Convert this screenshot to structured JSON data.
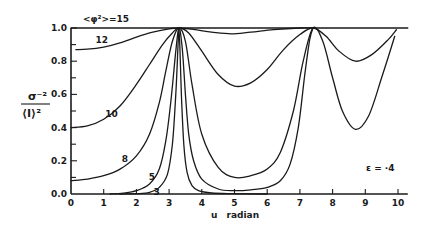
{
  "chart_data": {
    "type": "line",
    "title": "",
    "xlabel": "u radian",
    "ylabel_numerator": "σ⁻²",
    "ylabel_denominator": "⟨I⟩²",
    "annotation": "ε = ·4",
    "top_label": "<φ²>=15",
    "xlim": [
      0,
      10.3
    ],
    "ylim": [
      0,
      1.0
    ],
    "x_ticks": [
      "0",
      "1",
      "2",
      "3",
      "4",
      "5",
      "6",
      "7",
      "8",
      "9",
      "10"
    ],
    "y_ticks": [
      "0.0",
      "0.2",
      "0.4",
      "0.6",
      "0.8",
      "1.0"
    ],
    "grid": false,
    "series": [
      {
        "name": "15",
        "label_pos": [
          0.3,
          1.03
        ],
        "x": [
          0,
          10.3
        ],
        "y": [
          1.0,
          1.0
        ]
      },
      {
        "name": "12",
        "label_pos": [
          0.75,
          0.93
        ],
        "x": [
          0.15,
          0.5,
          1.0,
          1.5,
          2.0,
          2.5,
          3.0,
          3.3,
          3.8,
          4.3,
          4.9,
          5.5,
          6.2,
          7.0,
          7.4
        ],
        "y": [
          0.87,
          0.872,
          0.885,
          0.91,
          0.945,
          0.975,
          0.995,
          1.0,
          0.99,
          0.975,
          0.965,
          0.975,
          0.99,
          1.0,
          1.0
        ]
      },
      {
        "name": "10",
        "label_pos": [
          1.05,
          0.48
        ],
        "x": [
          0,
          0.5,
          1.0,
          1.5,
          2.0,
          2.4,
          2.8,
          3.1,
          3.3,
          3.6,
          4.0,
          4.5,
          5.0,
          5.5,
          6.0,
          6.5,
          7.0,
          7.4,
          7.8,
          8.2,
          8.7,
          9.2,
          9.7,
          9.95
        ],
        "y": [
          0.4,
          0.41,
          0.45,
          0.53,
          0.66,
          0.78,
          0.9,
          0.97,
          1.0,
          0.97,
          0.86,
          0.72,
          0.65,
          0.67,
          0.75,
          0.87,
          0.96,
          1.0,
          0.95,
          0.86,
          0.8,
          0.84,
          0.93,
          0.99
        ]
      },
      {
        "name": "8",
        "label_pos": [
          1.55,
          0.21
        ],
        "x": [
          0,
          0.5,
          1.0,
          1.5,
          2.0,
          2.4,
          2.7,
          2.9,
          3.1,
          3.3,
          3.5,
          3.7,
          4.0,
          4.5,
          5.0,
          5.5,
          6.0,
          6.4,
          6.8,
          7.1,
          7.4,
          7.7,
          8.0,
          8.3,
          8.7,
          9.1,
          9.5,
          9.9
        ],
        "y": [
          0.08,
          0.09,
          0.11,
          0.15,
          0.23,
          0.36,
          0.55,
          0.74,
          0.92,
          1.0,
          0.92,
          0.66,
          0.36,
          0.16,
          0.1,
          0.11,
          0.15,
          0.25,
          0.5,
          0.8,
          1.0,
          0.92,
          0.7,
          0.5,
          0.39,
          0.47,
          0.7,
          0.95
        ]
      },
      {
        "name": "5",
        "label_pos": [
          2.38,
          0.1
        ],
        "x": [
          1.2,
          1.6,
          2.0,
          2.4,
          2.7,
          2.9,
          3.05,
          3.2,
          3.3,
          3.4,
          3.5,
          3.6,
          3.75,
          4.0,
          4.5,
          5.0,
          5.5,
          6.0,
          6.4,
          6.7,
          6.95,
          7.15,
          7.3,
          7.4
        ],
        "y": [
          0.0,
          0.005,
          0.02,
          0.06,
          0.15,
          0.32,
          0.55,
          0.85,
          1.0,
          0.88,
          0.6,
          0.36,
          0.2,
          0.09,
          0.03,
          0.02,
          0.025,
          0.04,
          0.08,
          0.18,
          0.4,
          0.72,
          0.93,
          1.0
        ]
      },
      {
        "name": "3",
        "label_pos": [
          2.52,
          0.01
        ],
        "x": [
          1.5,
          2.0,
          2.4,
          2.7,
          2.95,
          3.1,
          3.2,
          3.27,
          3.3,
          3.33,
          3.38,
          3.45,
          3.55,
          3.7,
          3.9,
          4.3,
          5.0,
          6.0
        ],
        "y": [
          0.0,
          0.002,
          0.01,
          0.04,
          0.12,
          0.3,
          0.58,
          0.88,
          1.0,
          0.88,
          0.58,
          0.3,
          0.13,
          0.05,
          0.02,
          0.006,
          0.002,
          0.0
        ]
      }
    ]
  }
}
